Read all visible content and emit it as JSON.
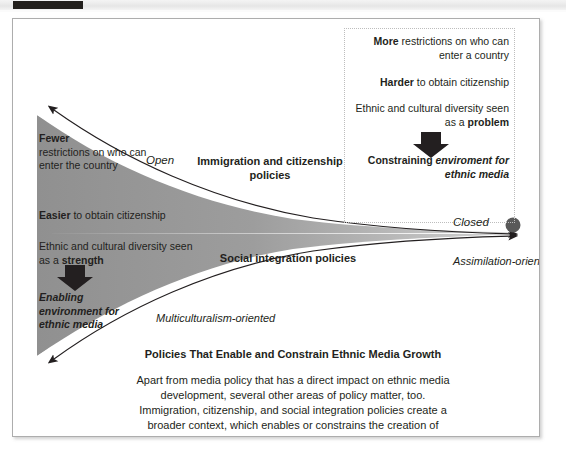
{
  "page": {
    "top_bar_label": "scan-edge-bar"
  },
  "figure": {
    "watermark": "CNN",
    "left_axis": {
      "fewer_bold": "Fewer",
      "fewer_rest": "restrictions on who can enter the country",
      "easier_bold": "Easier",
      "easier_rest": " to obtain citizenship",
      "diversity_lead": "Ethnic and cultural diversity seen as a ",
      "diversity_bold": "strength",
      "enabling": "Enabling environment for ethnic media"
    },
    "right_axis": {
      "more_bold": "More",
      "more_rest": " restrictions on who can enter a country",
      "harder_bold": "Harder",
      "harder_rest": " to obtain citizenship",
      "diversity_lead": "Ethnic and cultural diversity seen as a ",
      "diversity_bold": "problem",
      "constraining_plain": "Constraining ",
      "constraining_italic": "enviroment for ethnic media"
    },
    "funnel_labels": {
      "open": "Open",
      "closed": "Closed",
      "multiculturalism": "Multiculturalism-oriented",
      "assimilation": "Assimilation-oriented"
    },
    "axis_titles": {
      "immigration": "Immigration and citizenship policies",
      "social": "Social integration policies"
    },
    "caption": {
      "title": "Policies That Enable and Constrain Ethnic Media Growth",
      "body": "Apart from media policy that has a direct impact on ethnic media development, several other areas of policy matter, too. Immigration, citizenship, and social integration policies create a broader context, which enables or constrains the creation of ethnic media."
    },
    "colors": {
      "funnel_fill": "#8c8c8c",
      "funnel_fill_light": "#c9c9c9",
      "text": "#231f20",
      "frame_border": "#adadad",
      "dotted_border": "#bdbdbd",
      "dot": "#595959",
      "top_block": "#221f1c"
    }
  }
}
